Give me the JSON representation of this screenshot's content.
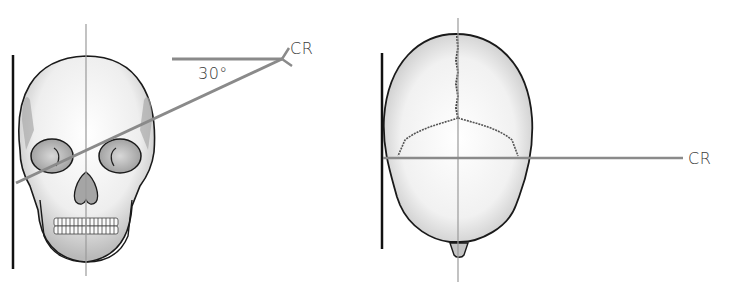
{
  "figure": {
    "left_panel": {
      "view": "frontal skull with 30° angled central ray",
      "angle_label": "30°",
      "ray_label": "CR"
    },
    "right_panel": {
      "view": "superior/posterior skull with perpendicular central ray",
      "ray_label": "CR"
    }
  },
  "colors": {
    "ray": "#8a8a8a",
    "outline": "#1a1a1a",
    "midline": "#9a9a9a",
    "image_receptor": "#111111"
  }
}
